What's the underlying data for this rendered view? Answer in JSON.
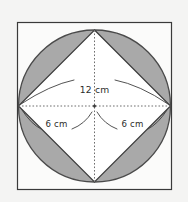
{
  "figure": {
    "name": "circle-inscribed-in-square-with-inscribed-diamond",
    "background_color": "#f4f4f3",
    "square": {
      "name": "outer-square",
      "x": 17.5,
      "y": 22.5,
      "width": 154,
      "height": 167,
      "stroke": "#3a3a3a",
      "stroke_width": 1.2,
      "fill": "#fbfbfa"
    },
    "circle": {
      "name": "inscribed-circle",
      "cx": 94.5,
      "cy": 106,
      "r": 76,
      "stroke": "#4a4a4a",
      "stroke_width": 1.3,
      "fill": "#a9a9a9"
    },
    "diamond": {
      "name": "inscribed-diamond",
      "points": "94.5,30 170.5,106 94.5,182 18.5,106",
      "stroke": "#3a3a3a",
      "stroke_width": 1.2,
      "fill": "#ffffff"
    },
    "diagonals": {
      "horizontal": {
        "x1": 18.5,
        "y1": 106,
        "x2": 170.5,
        "y2": 106
      },
      "vertical": {
        "x1": 94.5,
        "y1": 30,
        "x2": 94.5,
        "y2": 182
      },
      "stroke": "#6e6e6e",
      "dash": "1.6 1.9"
    },
    "center_dot": {
      "cx": 94.5,
      "cy": 106,
      "r": 1.5,
      "fill": "#3a3a3a"
    }
  },
  "annotations": {
    "diameter": {
      "label": "12 cm",
      "label_x": 94.5,
      "label_y": 94,
      "arc_path": "M 21 104 Q 94.5 78 168 104",
      "stroke": "#3f3f3f"
    },
    "radius_left": {
      "label": "6 cm",
      "label_x": 56,
      "label_y": 126,
      "arc_path": "M 22 110 Q 58 136 93 112",
      "stroke": "#3f3f3f"
    },
    "radius_right": {
      "label": "6 cm",
      "label_x": 133,
      "label_y": 126,
      "arc_path": "M 96 112 Q 131 136 167 110",
      "stroke": "#3f3f3f"
    }
  },
  "colors": {
    "shaded_segment": "#a9a9a9",
    "diamond_fill": "#ffffff",
    "outline": "#3a3a3a",
    "page_background": "#f4f4f3"
  }
}
